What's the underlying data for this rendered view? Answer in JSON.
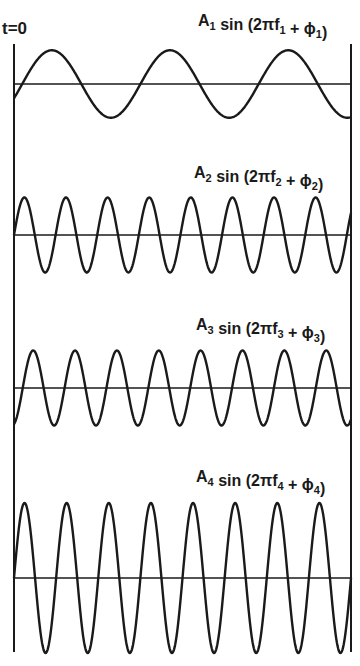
{
  "diagram": {
    "time_origin_label": "t=0",
    "stroke_color": "#1a1a1a",
    "background": "#ffffff",
    "components": [
      {
        "id": 1,
        "label": {
          "amp": "A",
          "sub": "1",
          "func": "sin",
          "open": "(2πf",
          "plus": "+",
          "phi": "ϕ",
          "close": ")"
        },
        "relative_amplitude": 0.45,
        "cycles_shown": 2.85,
        "start_phase_deg": -25
      },
      {
        "id": 2,
        "label": {
          "amp": "A",
          "sub": "2",
          "func": "sin",
          "open": "(2πf",
          "plus": "+",
          "phi": "ϕ",
          "close": ")"
        },
        "relative_amplitude": 0.5,
        "cycles_shown": 8.1,
        "start_phase_deg": 0
      },
      {
        "id": 3,
        "label": {
          "amp": "A",
          "sub": "3",
          "func": "sin",
          "open": "(2πf",
          "plus": "+",
          "phi": "ϕ",
          "close": ")"
        },
        "relative_amplitude": 0.5,
        "cycles_shown": 8.05,
        "start_phase_deg": -75
      },
      {
        "id": 4,
        "label": {
          "amp": "A",
          "sub": "4",
          "func": "sin",
          "open": "(2πf",
          "plus": "+",
          "phi": "ϕ",
          "close": ")"
        },
        "relative_amplitude": 1.0,
        "cycles_shown": 8.0,
        "start_phase_deg": 0
      }
    ]
  }
}
